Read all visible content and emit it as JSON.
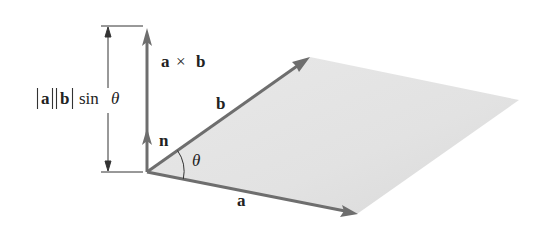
{
  "diagram": {
    "labels": {
      "cross_product": "a × b",
      "cross_a": "a",
      "cross_times": "×",
      "cross_b": "b",
      "unit_normal": "n",
      "vector_a": "a",
      "vector_b": "b",
      "angle": "θ",
      "magnitude_abs_a": "a",
      "magnitude_abs_b": "b",
      "magnitude_sin": "sin",
      "magnitude_theta": "θ",
      "magnitude_full": "|a||b| sin θ"
    },
    "geometry": {
      "origin": [
        147,
        172
      ],
      "vector_a_tip": [
        357,
        214
      ],
      "vector_b_tip": [
        310,
        57
      ],
      "parallelogram_far_vertex": [
        519,
        100
      ],
      "cross_product_tip": [
        147,
        28
      ],
      "unit_normal_tip": [
        147,
        128
      ],
      "dimension_line_x": 108,
      "dimension_top_y": 26,
      "dimension_bottom_y": 172
    },
    "colors": {
      "arrow": "#6e6e6e",
      "parallelogram_fill": "#e3e3e3",
      "line": "#333333",
      "text": "#222222",
      "background": "#ffffff"
    }
  }
}
